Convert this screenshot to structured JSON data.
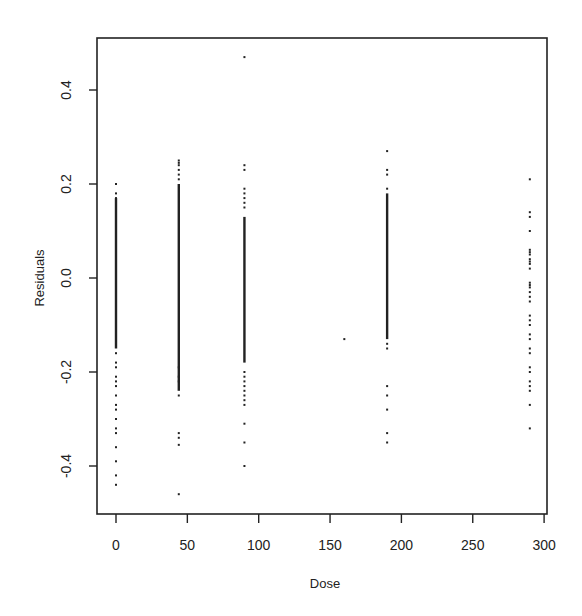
{
  "chart_data": {
    "type": "scatter",
    "title": "",
    "xlabel": "Dose",
    "ylabel": "Residuals",
    "xlim": [
      -10,
      305
    ],
    "ylim": [
      -0.5,
      0.5
    ],
    "grid": false,
    "legend": null,
    "x_ticks": [
      0,
      50,
      100,
      150,
      200,
      250,
      300
    ],
    "x_tick_labels": [
      "0",
      "50",
      "100",
      "150",
      "200",
      "250",
      "300"
    ],
    "y_ticks": [
      -0.4,
      -0.2,
      0.0,
      0.2,
      0.4
    ],
    "y_tick_labels": [
      "-0.4",
      "-0.2",
      "0.0",
      "0.2",
      "0.4"
    ],
    "point_color": "#222222",
    "columns": [
      {
        "dose": 0,
        "dense_range": [
          -0.15,
          0.17
        ],
        "points": [
          0.2,
          0.18,
          0.17,
          -0.16,
          -0.18,
          -0.19,
          -0.21,
          -0.22,
          -0.23,
          -0.25,
          -0.27,
          -0.28,
          -0.3,
          -0.32,
          -0.33,
          -0.36,
          -0.39,
          -0.42,
          -0.44
        ]
      },
      {
        "dose": 44,
        "dense_range": [
          -0.24,
          0.2
        ],
        "points": [
          0.25,
          0.245,
          0.24,
          0.23,
          0.22,
          0.21,
          -0.25,
          -0.19,
          -0.21,
          -0.22,
          -0.33,
          -0.34,
          -0.355,
          -0.46
        ]
      },
      {
        "dose": 90,
        "dense_range": [
          -0.18,
          0.13
        ],
        "points": [
          0.47,
          0.24,
          0.23,
          0.19,
          0.18,
          0.17,
          0.16,
          0.15,
          -0.2,
          -0.21,
          -0.22,
          -0.23,
          -0.24,
          -0.25,
          -0.26,
          -0.27,
          -0.31,
          -0.35,
          -0.4
        ]
      },
      {
        "dose": 160,
        "dense_range": null,
        "points": [
          -0.13
        ]
      },
      {
        "dose": 190,
        "dense_range": [
          -0.13,
          0.18
        ],
        "points": [
          0.27,
          0.23,
          0.22,
          0.19,
          -0.14,
          -0.15,
          -0.23,
          -0.25,
          -0.28,
          -0.33,
          -0.35
        ]
      },
      {
        "dose": 290,
        "dense_range": null,
        "points": [
          0.21,
          0.14,
          0.13,
          0.1,
          0.06,
          0.055,
          0.05,
          0.04,
          0.035,
          0.03,
          0.02,
          -0.01,
          -0.015,
          -0.02,
          -0.03,
          -0.04,
          -0.05,
          -0.08,
          -0.09,
          -0.1,
          -0.12,
          -0.13,
          -0.15,
          -0.16,
          -0.19,
          -0.2,
          -0.22,
          -0.23,
          -0.24,
          -0.27,
          -0.32
        ]
      }
    ]
  }
}
